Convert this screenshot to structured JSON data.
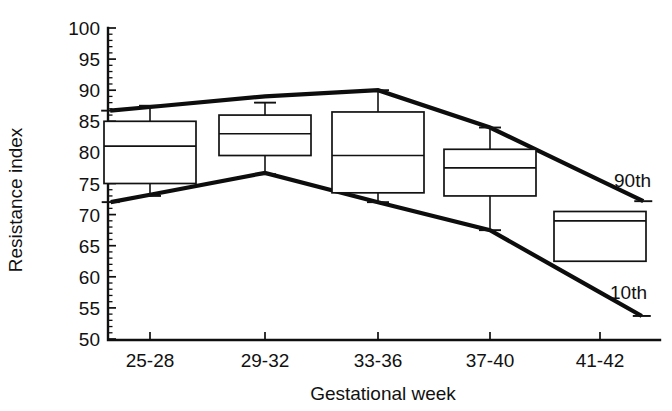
{
  "chart_data": {
    "type": "box",
    "title": "",
    "xlabel": "Gestational week",
    "ylabel": "Resistance index",
    "categories": [
      "25-28",
      "29-32",
      "33-36",
      "37-40",
      "41-42"
    ],
    "ylim": [
      50,
      100
    ],
    "yticks": [
      50,
      55,
      60,
      65,
      70,
      75,
      80,
      85,
      90,
      95,
      100
    ],
    "ytick_labels": [
      "50",
      "55",
      "60",
      "65",
      "70",
      "75",
      "80",
      "85",
      "90",
      "95",
      "100"
    ],
    "grid": false,
    "legend": "none",
    "boxes": [
      {
        "category": "25-28",
        "q1": 75.0,
        "median": 81.0,
        "q3": 85.0,
        "lower_whisker": 73.0,
        "upper_whisker": 87.5
      },
      {
        "category": "29-32",
        "q1": 79.5,
        "median": 83.0,
        "q3": 86.0,
        "lower_whisker": 76.5,
        "upper_whisker": 88.0
      },
      {
        "category": "33-36",
        "q1": 73.5,
        "median": 79.5,
        "q3": 86.5,
        "lower_whisker": 72.0,
        "upper_whisker": 90.0
      },
      {
        "category": "37-40",
        "q1": 73.0,
        "median": 77.5,
        "q3": 80.5,
        "lower_whisker": 67.5,
        "upper_whisker": 84.0
      },
      {
        "category": "41-42",
        "q1": 62.5,
        "median": 69.0,
        "q3": 70.5,
        "lower_whisker": null,
        "upper_whisker": null
      }
    ],
    "series": [
      {
        "name": "90th",
        "label": "90th",
        "values": [
          87.3,
          89.0,
          90.0,
          84.0,
          75.5
        ]
      },
      {
        "name": "10th",
        "label": "10th",
        "values": [
          73.2,
          76.7,
          72.0,
          67.5,
          57.5
        ]
      }
    ],
    "annotations": [
      {
        "text": "90th",
        "series": "90th"
      },
      {
        "text": "10th",
        "series": "10th"
      }
    ]
  },
  "axis": {
    "y_title": "Resistance index",
    "x_title": "Gestational week"
  }
}
